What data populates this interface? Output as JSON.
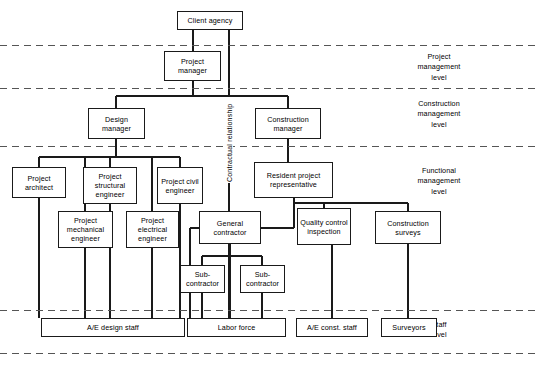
{
  "diagram": {
    "type": "organization-chart",
    "colors": {
      "box_border": "#1a1a1a",
      "connector": "#1a1a1a",
      "divider": "#555555",
      "background": "#ffffff"
    },
    "nodes": [
      {
        "id": "client_agency",
        "label": "Client agency",
        "x": 177,
        "y": 11,
        "w": 66,
        "h": 19,
        "level": "top"
      },
      {
        "id": "project_manager",
        "label": "Project manager",
        "x": 164,
        "y": 51,
        "w": 57,
        "h": 30,
        "level": "project_management"
      },
      {
        "id": "design_manager",
        "label": "Design manager",
        "x": 88,
        "y": 108,
        "w": 57,
        "h": 31,
        "level": "construction_management"
      },
      {
        "id": "construction_manager",
        "label": "Construction manager",
        "x": 255,
        "y": 108,
        "w": 66,
        "h": 31,
        "level": "construction_management"
      },
      {
        "id": "project_architect",
        "label": "Project architect",
        "x": 12,
        "y": 167,
        "w": 54,
        "h": 31,
        "level": "functional_management"
      },
      {
        "id": "project_structural_engineer",
        "label": "Project structural engineer",
        "x": 83,
        "y": 167,
        "w": 54,
        "h": 37,
        "level": "functional_management"
      },
      {
        "id": "project_civil_engineer",
        "label": "Project civil engineer",
        "x": 157,
        "y": 167,
        "w": 46,
        "h": 37,
        "level": "functional_management"
      },
      {
        "id": "resident_project_representative",
        "label": "Resident project representative",
        "x": 254,
        "y": 162,
        "w": 79,
        "h": 36,
        "level": "functional_management"
      },
      {
        "id": "project_mechanical_engineer",
        "label": "Project mechanical engineer",
        "x": 58,
        "y": 211,
        "w": 55,
        "h": 37,
        "level": "functional_management"
      },
      {
        "id": "project_electrical_engineer",
        "label": "Project electrical engineer",
        "x": 126,
        "y": 211,
        "w": 53,
        "h": 37,
        "level": "functional_management"
      },
      {
        "id": "general_contractor",
        "label": "General contractor",
        "x": 199,
        "y": 211,
        "w": 62,
        "h": 33,
        "level": "functional_management"
      },
      {
        "id": "quality_control_inspection",
        "label": "Quality control inspection",
        "x": 297,
        "y": 208,
        "w": 54,
        "h": 37,
        "level": "functional_management"
      },
      {
        "id": "construction_surveys",
        "label": "Construction surveys",
        "x": 375,
        "y": 211,
        "w": 66,
        "h": 33,
        "level": "functional_management"
      },
      {
        "id": "subcontractor_1",
        "label": "Sub- contractor",
        "x": 180,
        "y": 265,
        "w": 45,
        "h": 28,
        "level": "functional_management"
      },
      {
        "id": "subcontractor_2",
        "label": "Sub- contractor",
        "x": 240,
        "y": 265,
        "w": 45,
        "h": 28,
        "level": "functional_management"
      },
      {
        "id": "ae_design_staff",
        "label": "A/E design staff",
        "x": 41,
        "y": 318,
        "w": 144,
        "h": 19,
        "level": "staff"
      },
      {
        "id": "labor_force",
        "label": "Labor force",
        "x": 187,
        "y": 318,
        "w": 99,
        "h": 19,
        "level": "staff"
      },
      {
        "id": "ae_const_staff",
        "label": "A/E const. staff",
        "x": 296,
        "y": 318,
        "w": 72,
        "h": 19,
        "level": "staff"
      },
      {
        "id": "surveyors",
        "label": "Surveyors",
        "x": 381,
        "y": 318,
        "w": 56,
        "h": 19,
        "level": "staff"
      }
    ],
    "level_labels": [
      {
        "id": "project_management_level",
        "line1": "Project",
        "line2": "management",
        "line3": "level",
        "x": 399,
        "y": 52
      },
      {
        "id": "construction_management_level",
        "line1": "Construction",
        "line2": "management",
        "line3": "level",
        "x": 399,
        "y": 99
      },
      {
        "id": "functional_management_level",
        "line1": "Functional",
        "line2": "management",
        "line3": "level",
        "x": 399,
        "y": 166
      },
      {
        "id": "staff_level",
        "line1": "Staff",
        "line2": "level",
        "line3": "",
        "x": 399,
        "y": 320
      }
    ],
    "annotations": [
      {
        "id": "contractual_relationship",
        "label": "Contractual relationship",
        "x": 229,
        "y": 183,
        "rotation": -90
      }
    ],
    "dividers": [
      {
        "id": "divider-1",
        "y": 45
      },
      {
        "id": "divider-2",
        "y": 88
      },
      {
        "id": "divider-3",
        "y": 146
      },
      {
        "id": "divider-4",
        "y": 310
      },
      {
        "id": "divider-5",
        "y": 353
      }
    ],
    "connectors": [
      "client_agency -> project_manager",
      "project_manager -> design_manager",
      "project_manager -> construction_manager",
      "client_agency -> construction_manager (contractual)",
      "design_manager -> project_architect",
      "design_manager -> project_structural_engineer",
      "design_manager -> project_civil_engineer",
      "design_manager -> project_mechanical_engineer",
      "design_manager -> project_electrical_engineer",
      "construction_manager -> resident_project_representative",
      "resident_project_representative -> quality_control_inspection",
      "resident_project_representative -> construction_surveys",
      "resident_project_representative -> general_contractor",
      "general_contractor -> subcontractor_1",
      "general_contractor -> subcontractor_2",
      "project_architect -> ae_design_staff",
      "project_structural_engineer -> ae_design_staff",
      "project_civil_engineer -> ae_design_staff",
      "project_mechanical_engineer -> ae_design_staff",
      "project_electrical_engineer -> ae_design_staff",
      "general_contractor -> labor_force",
      "subcontractor_1 -> labor_force",
      "subcontractor_2 -> labor_force",
      "quality_control_inspection -> ae_const_staff",
      "construction_surveys -> surveyors"
    ]
  }
}
